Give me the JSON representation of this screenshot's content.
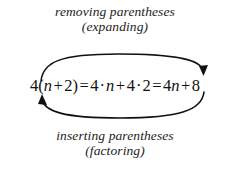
{
  "figure": {
    "background_color": "#ffffff",
    "text_color": "#111111",
    "caption_top": {
      "line1": "removing parentheses",
      "line2": "(expanding)"
    },
    "caption_bottom": {
      "line1": "inserting parentheses",
      "line2": "(factoring)"
    },
    "equation": {
      "full_text": "4(n + 2) = 4 · n + 4 · 2 = 4n + 8",
      "tokens": {
        "coefficient_1": "4",
        "paren_open": "(",
        "variable_1": "n",
        "plus_1": "+",
        "constant_2": "2",
        "paren_close": ")",
        "equals_1": "=",
        "coefficient_2": "4",
        "dot_1": "·",
        "variable_2": "n",
        "plus_2": "+",
        "coefficient_3": "4",
        "dot_2": "·",
        "constant_3": "2",
        "equals_2": "=",
        "coefficient_4": "4",
        "variable_3": "n",
        "plus_3": "+",
        "constant_4": "8"
      }
    },
    "arrows": {
      "top": {
        "label": "removing parentheses (expanding)",
        "direction": "left-to-right",
        "color": "#111111"
      },
      "bottom": {
        "label": "inserting parentheses (factoring)",
        "direction": "right-to-left",
        "color": "#111111"
      }
    }
  }
}
